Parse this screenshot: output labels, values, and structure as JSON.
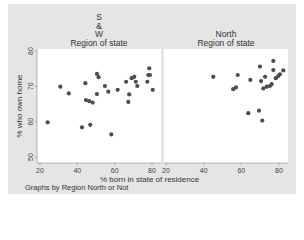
{
  "chart_data": [
    {
      "type": "scatter",
      "panel_title": [
        "S",
        "&",
        "W",
        "Region of state"
      ],
      "xlabel": "% born in state of residence",
      "ylabel": "% who own home",
      "xlim": [
        20,
        85
      ],
      "ylim": [
        50,
        80
      ],
      "xticks": [
        20,
        40,
        60,
        80
      ],
      "yticks": [
        50,
        60,
        70,
        80
      ],
      "points": [
        [
          24.1,
          59.8
        ],
        [
          30.9,
          69.9
        ],
        [
          35.4,
          68.0
        ],
        [
          44.3,
          70.9
        ],
        [
          42.5,
          58.4
        ],
        [
          46.9,
          59.1
        ],
        [
          44.6,
          66.1
        ],
        [
          46.4,
          65.8
        ],
        [
          48.2,
          65.4
        ],
        [
          50.5,
          73.5
        ],
        [
          51.4,
          72.6
        ],
        [
          50.5,
          67.8
        ],
        [
          54.8,
          70.1
        ],
        [
          56.6,
          68.5
        ],
        [
          61.6,
          69.0
        ],
        [
          58.2,
          56.4
        ],
        [
          66.1,
          71.3
        ],
        [
          67.3,
          65.6
        ],
        [
          67.8,
          67.7
        ],
        [
          69.1,
          72.3
        ],
        [
          70.5,
          72.7
        ],
        [
          71.3,
          71.3
        ],
        [
          72.1,
          70.1
        ],
        [
          77.5,
          71.3
        ],
        [
          78.0,
          73.2
        ],
        [
          78.9,
          73.2
        ],
        [
          78.5,
          75.1
        ],
        [
          80.4,
          69.0
        ]
      ]
    },
    {
      "type": "scatter",
      "panel_title": [
        "North",
        "Region of state"
      ],
      "xlabel": "% born in state of residence",
      "ylabel": "% who own home",
      "xlim": [
        20,
        85
      ],
      "ylim": [
        50,
        80
      ],
      "xticks": [
        20,
        40,
        60,
        80
      ],
      "yticks": [
        50,
        60,
        70,
        80
      ],
      "points": [
        [
          45.1,
          72.7
        ],
        [
          55.7,
          69.2
        ],
        [
          57.2,
          69.7
        ],
        [
          58.1,
          73.2
        ],
        [
          64.8,
          71.8
        ],
        [
          69.9,
          75.6
        ],
        [
          70.5,
          71.5
        ],
        [
          72.6,
          72.7
        ],
        [
          71.7,
          69.4
        ],
        [
          73.5,
          69.9
        ],
        [
          75.2,
          70.1
        ],
        [
          76.1,
          70.6
        ],
        [
          77.0,
          77.2
        ],
        [
          77.0,
          74.6
        ],
        [
          78.3,
          72.3
        ],
        [
          79.6,
          72.9
        ],
        [
          80.5,
          73.4
        ],
        [
          82.3,
          74.5
        ],
        [
          63.7,
          62.4
        ],
        [
          69.4,
          63.1
        ],
        [
          71.1,
          60.3
        ]
      ]
    }
  ],
  "labels": {
    "left_title_1": "S",
    "left_title_2": "&",
    "left_title_3": "W",
    "left_title_4": "Region of state",
    "right_title_1": "North",
    "right_title_2": "Region of state",
    "ylabel": "% who own home",
    "xlabel": "% born in state of residence",
    "note": "Graphs by Region North or Not"
  },
  "colors": {
    "marker": "#4d4d4d",
    "frame": "#e5e5e5",
    "plot_bg": "#ffffff"
  }
}
